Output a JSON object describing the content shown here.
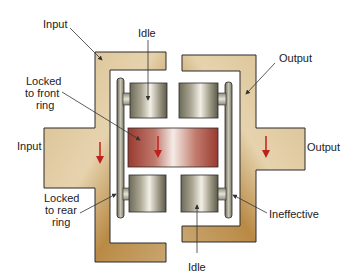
{
  "diagram": {
    "colors": {
      "housing": "#d2b48c",
      "housing_dark": "#a87a3c",
      "roller_light": "#e8e4d8",
      "roller_dark": "#6e6a58",
      "center_red": "#a8443a",
      "arrow_red": "#c0201c",
      "outline": "#2a2a2a",
      "leader": "#333333"
    },
    "labels": {
      "input_top": "Input",
      "idle_top": "Idle",
      "output_top": "Output",
      "locked_front_line1": "Locked",
      "locked_front_line2": "to front",
      "locked_front_line3": "ring",
      "input_left": "Input",
      "output_right": "Output",
      "locked_rear_line1": "Locked",
      "locked_rear_line2": "to rear",
      "locked_rear_line3": "ring",
      "ineffective": "Ineffective",
      "idle_bottom": "Idle"
    },
    "components": [
      {
        "name": "input-housing",
        "side": "left"
      },
      {
        "name": "output-housing",
        "side": "right"
      },
      {
        "name": "front-ring-plate"
      },
      {
        "name": "rear-ring-plate"
      },
      {
        "name": "center-roller"
      },
      {
        "name": "top-left-roller"
      },
      {
        "name": "top-right-roller"
      },
      {
        "name": "bottom-left-roller"
      },
      {
        "name": "bottom-right-roller"
      }
    ]
  }
}
